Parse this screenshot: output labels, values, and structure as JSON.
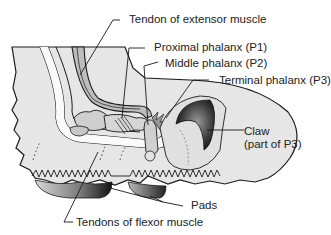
{
  "diagram": {
    "type": "anatomical-cross-section",
    "labels": {
      "extensor_tendon": "Tendon of extensor muscle",
      "p1": "Proximal phalanx (P1)",
      "p2": "Middle phalanx (P2)",
      "p3": "Terminal phalanx (P3)",
      "claw_line1": "Claw",
      "claw_line2": "(part of P3)",
      "pads": "Pads",
      "flexor_tendons": "Tendons of flexor muscle"
    },
    "colors": {
      "skin_fill": "#e6e6e6",
      "outline": "#1a1a1a",
      "bone_fill": "#cfcfcf",
      "tendon_fill": "#bdbdbd",
      "claw_dark": "#2a2a2a",
      "pad_dark": "#333333",
      "background": "#ffffff"
    }
  }
}
